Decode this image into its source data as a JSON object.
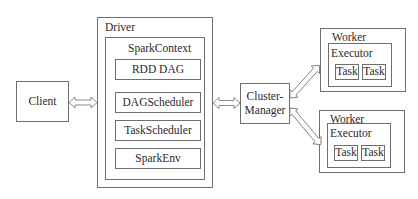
{
  "client": {
    "label": "Client"
  },
  "driver": {
    "label": "Driver",
    "spark_context": {
      "label": "SparkContext",
      "components": [
        {
          "label": "RDD DAG"
        },
        {
          "label": "DAGScheduler"
        },
        {
          "label": "TaskScheduler"
        },
        {
          "label": "SparkEnv"
        }
      ]
    }
  },
  "cluster_manager": {
    "label_line1": "Cluster-",
    "label_line2": "Manager"
  },
  "workers": [
    {
      "label": "Worker",
      "executor": {
        "label": "Executor",
        "tasks": [
          {
            "label": "Task"
          },
          {
            "label": "Task"
          }
        ]
      }
    },
    {
      "label": "Worker",
      "executor": {
        "label": "Executor",
        "tasks": [
          {
            "label": "Task"
          },
          {
            "label": "Task"
          }
        ]
      }
    }
  ],
  "colors": {
    "line": "#6e6e6e",
    "text": "#2a2a2a",
    "background": "#ffffff"
  }
}
